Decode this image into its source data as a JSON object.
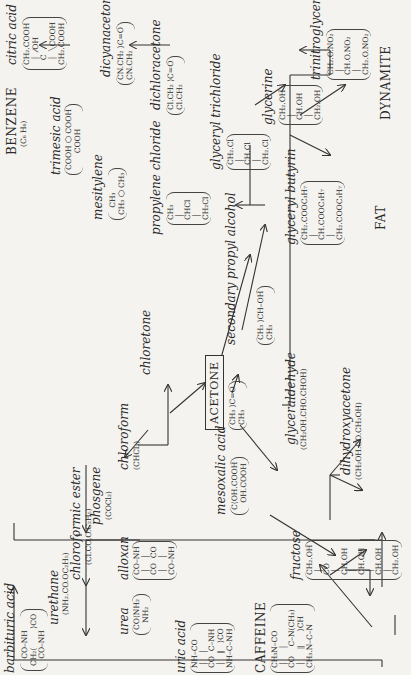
{
  "diagram": {
    "center": {
      "label": "ACETONE",
      "formula": "CH₃ ⟩C=O\nCH₃"
    },
    "compounds": {
      "citric_acid": {
        "label": "citric acid",
        "formula": "CH₂.COOH\n  │  ⁄OH\n  C\n  │  ╲COOH\nCH₂.COOH"
      },
      "dicyanacetone": {
        "label": "dicyanacetone*",
        "formula": "CN.CH₂ ⟩C=O\nCN.CH₂"
      },
      "dichloracetone": {
        "label": "dichloracetone",
        "formula": "Cl.CH₂ ⟩C=O\nCl.CH₂"
      },
      "trimesic_acid": {
        "label": "trimesic acid",
        "formula": "COOH ⬡ COOH\n       COOH"
      },
      "benzene": {
        "label": "BENZENE",
        "formula": "(C₆ H₆)"
      },
      "mesitylene": {
        "label": "mesitylene",
        "formula": "   CH₃\nCH₃ ⬡ CH₃"
      },
      "propylene_chloride": {
        "label": "propylene chloride",
        "formula": "CH₃\n │\nCHCl\n │\nCH₂Cl"
      },
      "glyceryl_trichloride": {
        "label": "glyceryl trichloride",
        "formula": "CH₂.Cl\n │\nCH.Cl\n │\nCH₂.Cl"
      },
      "glycerine": {
        "label": "glycerine",
        "formula": "CH₂.OH\n │\nCH.OH\n │\nCH₂.OH"
      },
      "trinitroglycerine": {
        "label": "trinitroglycerine",
        "formula": "CH₂.O.NO₂\n │\nCH.O.NO₂\n │\nCH₂.O.NO₂"
      },
      "dynamite": {
        "label": "DYNAMITE"
      },
      "secondary_propyl_alcohol": {
        "label": "secondary propyl alcohol",
        "formula": "CH₃ ⟩CH–OH\nCH₃"
      },
      "glyceryl_butyrin": {
        "label": "glyceryl butyrin",
        "formula": "CH₂.COOC₃H₇\n │\nCH.COOC₃H₇\n │\nCH₂.COOC₃H₇"
      },
      "fat": {
        "label": "FAT"
      },
      "chloretone": {
        "label": "chloretone"
      },
      "chloroform": {
        "label": "chloroform",
        "formula": "(CHCl₃)"
      },
      "phosgene": {
        "label": "phosgene",
        "formula": "(COCl₂)"
      },
      "chloroformic_ester": {
        "label": "chloroformic ester",
        "formula": "(Cl.CO.O.C₂H₅)"
      },
      "urethane": {
        "label": "urethane",
        "formula": "(NH₂.CO.OC₂H₅)"
      },
      "barbituric_acid": {
        "label": "barbituric acid",
        "formula": "   CO–NH\nCH₂⟨        ⟩CO\n   CO–NH"
      },
      "urea": {
        "label": "urea",
        "formula": "CO⟨NH₂\n   NH₂"
      },
      "alloxan": {
        "label": "alloxan",
        "formula": "CO–NH\n │    │\nCO  CO\n │    │\nCO–NH"
      },
      "uric_acid": {
        "label": "uric acid",
        "formula": "NH–CO\n │   │\nCO  C–NH\n │   ‖   ⟩CO\nNH–C–NH"
      },
      "mesoxalic_acid": {
        "label": "mesoxalic acid",
        "formula": "C⟨OH.COOH\n   OH.COOH"
      },
      "glyceraldehyde": {
        "label": "glyceraldehyde",
        "formula": "(CH₂OH.CHO.CHOH)"
      },
      "dihydroxyacetone": {
        "label": "dihydroxyacetone",
        "formula": "(CH₂OH.CO.CH₂OH)"
      },
      "fructose": {
        "label": "fructose",
        "formula": "CH₂.OH\n │\nCO\n │\nCH.OH\n │\nCH.OH\n │\nCH.OH\n │\nCH₂.OH"
      },
      "caffeine": {
        "label": "CAFFEINE",
        "formula": "CH₃N–CO\n │     │\nCO    C–N(CH₃)\n │     ‖      ⟩CH\nCH₃.N–C–N"
      }
    }
  }
}
